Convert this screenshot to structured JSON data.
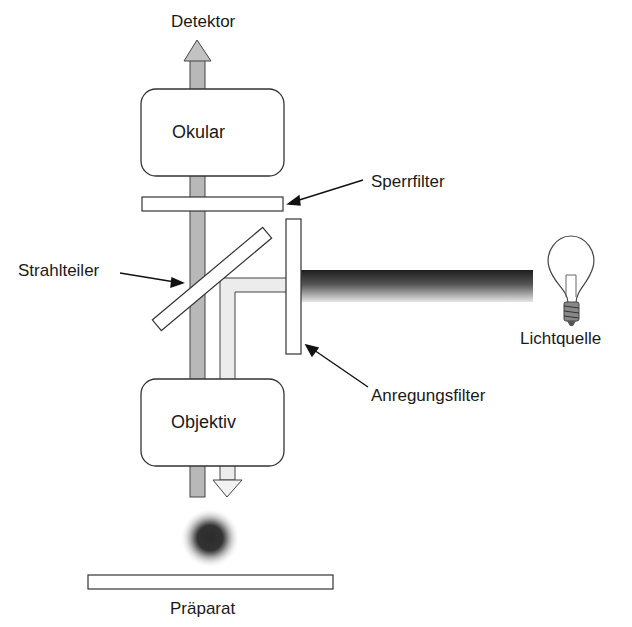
{
  "diagram": {
    "labels": {
      "detector": "Detektor",
      "eyepiece": "Okular",
      "barrier_filter": "Sperrfilter",
      "beam_splitter": "Strahlteiler",
      "light_source": "Lichtquelle",
      "excitation_filter": "Anregungsfilter",
      "objective": "Objektiv",
      "specimen": "Präparat"
    },
    "icons": {
      "light_source": "light-bulb-icon",
      "detector_arrow": "arrow-up-icon",
      "excitation_arrow": "arrow-down-icon"
    },
    "colors": {
      "emission_beam": "#b8b8b8",
      "excitation_beam": "#ececec",
      "light_beam_dark": "#2a2a2a",
      "outline": "#333333",
      "specimen_spot": "#3a3a3a"
    }
  }
}
